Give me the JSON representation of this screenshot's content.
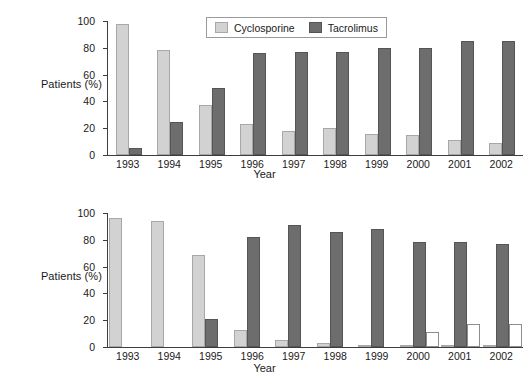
{
  "figure": {
    "title": "",
    "panels": [
      "A",
      "B"
    ]
  },
  "panel_a": {
    "ylabel": "Patients (%)",
    "xlabel": "Year",
    "yticks": [
      "100",
      "80",
      "60",
      "40",
      "20",
      "0"
    ],
    "xticks": [
      "1993",
      "1994",
      "1995",
      "1996",
      "1997",
      "1998",
      "1999",
      "2000",
      "2001",
      "2002"
    ],
    "legend": [
      {
        "label": "Cyclosporine",
        "color": "#d2d2d2"
      },
      {
        "label": "Tacrolimus",
        "color": "#6d6d6d"
      }
    ]
  },
  "panel_b": {
    "ylabel": "Patients (%)",
    "xlabel": "Year",
    "yticks": [
      "100",
      "80",
      "60",
      "40",
      "20",
      "0"
    ],
    "xticks": [
      "1993",
      "1994",
      "1995",
      "1996",
      "1997",
      "1998",
      "1999",
      "2000",
      "2001",
      "2002"
    ],
    "legend": [
      {
        "label": "Azathioprine",
        "color": "#d2d2d2"
      },
      {
        "label": "Mycophenolate mofetil",
        "color": "#6d6d6d"
      },
      {
        "label": "Sirolimus",
        "color": "#ffffff"
      }
    ]
  },
  "chart_data": [
    {
      "type": "bar",
      "title": "",
      "xlabel": "Year",
      "ylabel": "Patients (%)",
      "ylim": [
        0,
        100
      ],
      "yticks": [
        0,
        20,
        40,
        60,
        80,
        100
      ],
      "grid": false,
      "legend_position": "top-center",
      "categories": [
        "1993",
        "1994",
        "1995",
        "1996",
        "1997",
        "1998",
        "1999",
        "2000",
        "2001",
        "2002"
      ],
      "series": [
        {
          "name": "Cyclosporine",
          "color": "#d2d2d2",
          "values": [
            98,
            78,
            37,
            23,
            18,
            20,
            16,
            15,
            11,
            9
          ]
        },
        {
          "name": "Tacrolimus",
          "color": "#6d6d6d",
          "values": [
            5,
            25,
            50,
            76,
            77,
            77,
            80,
            80,
            85,
            85
          ]
        }
      ]
    },
    {
      "type": "bar",
      "title": "",
      "xlabel": "Year",
      "ylabel": "Patients (%)",
      "ylim": [
        0,
        100
      ],
      "yticks": [
        0,
        20,
        40,
        60,
        80,
        100
      ],
      "grid": false,
      "legend_position": "top-center",
      "categories": [
        "1993",
        "1994",
        "1995",
        "1996",
        "1997",
        "1998",
        "1999",
        "2000",
        "2001",
        "2002"
      ],
      "series": [
        {
          "name": "Azathioprine",
          "color": "#d2d2d2",
          "values": [
            96,
            94,
            69,
            13,
            5,
            3,
            1.5,
            1,
            1,
            1
          ]
        },
        {
          "name": "Mycophenolate mofetil",
          "color": "#6d6d6d",
          "values": [
            0,
            0,
            21,
            82,
            91,
            86,
            88,
            78,
            78,
            77
          ]
        },
        {
          "name": "Sirolimus",
          "color": "#ffffff",
          "values": [
            0,
            0,
            0,
            0,
            0,
            0,
            0,
            11,
            17,
            17.5
          ]
        }
      ]
    }
  ]
}
